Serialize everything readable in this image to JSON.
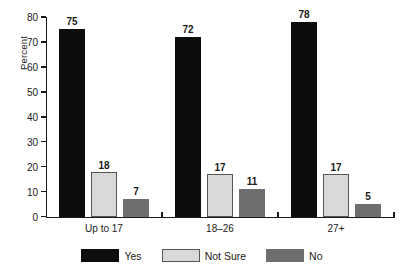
{
  "chart_data": {
    "type": "bar",
    "title": "",
    "subtitle": "",
    "xlabel": "",
    "ylabel": "Percent",
    "categories": [
      "Up to 17",
      "18–26",
      "27+"
    ],
    "series": [
      {
        "name": "Yes",
        "values": [
          75,
          72,
          78
        ],
        "color": "#0d0d0d"
      },
      {
        "name": "Not Sure",
        "values": [
          18,
          17,
          17
        ],
        "color": "#d9d9d9"
      },
      {
        "name": "No",
        "values": [
          7,
          11,
          5
        ],
        "color": "#6e6e6e"
      }
    ],
    "ylim": [
      0,
      80
    ],
    "ytick_step": 10,
    "yticks": [
      0,
      10,
      20,
      30,
      40,
      50,
      60,
      70,
      80
    ],
    "ytick_labels": [
      "0",
      "10",
      "20",
      "30",
      "40",
      "50",
      "60",
      "70",
      "80"
    ],
    "grid": false,
    "legend_position": "bottom",
    "data_labels": true,
    "value_labels": [
      [
        "75",
        "18",
        "7"
      ],
      [
        "72",
        "17",
        "11"
      ],
      [
        "78",
        "17",
        "5"
      ]
    ]
  },
  "axes": {
    "y_title": "Percent"
  },
  "legend": {
    "items": [
      {
        "label": "Yes",
        "swatch": "legend-swatch-yes"
      },
      {
        "label": "Not Sure",
        "swatch": "legend-swatch-not-sure"
      },
      {
        "label": "No",
        "swatch": "legend-swatch-no"
      }
    ]
  }
}
